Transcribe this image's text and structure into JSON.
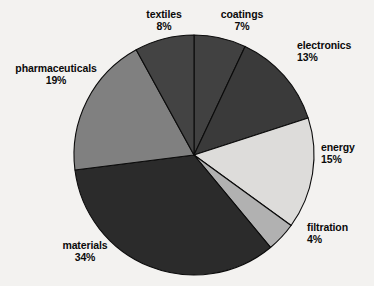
{
  "chart_data": {
    "type": "pie",
    "title": "",
    "subtitle": "",
    "xlabel": "",
    "ylabel": "",
    "legend_position": "none",
    "grid": false,
    "units": "percent",
    "total": 100,
    "start_angle_deg": 0,
    "direction": "clockwise",
    "categories": [
      "coatings",
      "electronics",
      "energy",
      "filtration",
      "materials",
      "pharmaceuticals",
      "textiles"
    ],
    "values": [
      7,
      13,
      15,
      4,
      34,
      19,
      8
    ],
    "slices": [
      {
        "label": "coatings",
        "value": 7,
        "percent_text": "7%",
        "color": "#414141"
      },
      {
        "label": "electronics",
        "value": 13,
        "percent_text": "13%",
        "color": "#3a3a3a"
      },
      {
        "label": "energy",
        "value": 15,
        "percent_text": "15%",
        "color": "#dddcda"
      },
      {
        "label": "filtration",
        "value": 4,
        "percent_text": "4%",
        "color": "#b1b1b1"
      },
      {
        "label": "materials",
        "value": 34,
        "percent_text": "34%",
        "color": "#2b2b2b"
      },
      {
        "label": "pharmaceuticals",
        "value": 19,
        "percent_text": "19%",
        "color": "#808080"
      },
      {
        "label": "textiles",
        "value": 8,
        "percent_text": "8%",
        "color": "#434343"
      }
    ]
  },
  "colors": {
    "background": "#f3f2f0",
    "outline": "#0b0b0b",
    "label_text": "#0a0a0a"
  },
  "labels": {
    "textiles": {
      "name": "textiles",
      "pct": "8%"
    },
    "coatings": {
      "name": "coatings",
      "pct": "7%"
    },
    "electronics": {
      "name": "electronics",
      "pct": "13%"
    },
    "energy": {
      "name": "energy",
      "pct": "15%"
    },
    "filtration": {
      "name": "filtration",
      "pct": "4%"
    },
    "materials": {
      "name": "materials",
      "pct": "34%"
    },
    "pharmaceuticals": {
      "name": "pharmaceuticals",
      "pct": "19%"
    }
  }
}
